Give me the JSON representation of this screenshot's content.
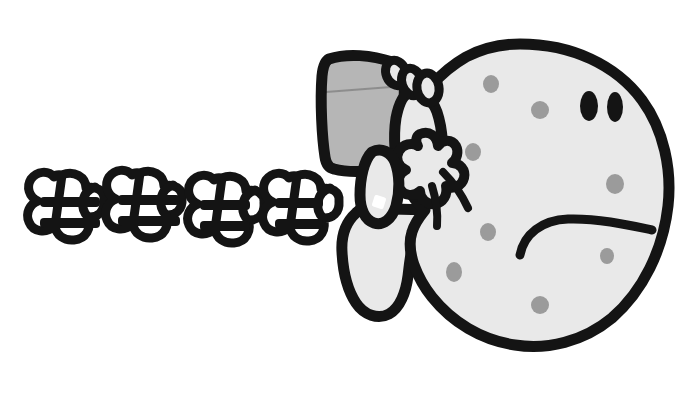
{
  "illustration": {
    "title": "Angry spotted character running and throwing hat",
    "subject": "cartoon-character",
    "background_color": "#ffffff",
    "ink_color": "#141414",
    "body_fill_color": "#e9e9e9",
    "hat_fill_color": "#b6b6b6",
    "spot_color": "#9b9b9b",
    "eye_color": "#141414",
    "mood": "sad-angry"
  },
  "character": {
    "body": {
      "name": "round-spotted-body",
      "outline_width": 11,
      "center": {
        "x": 520,
        "y": 195
      },
      "radius_x": 130,
      "radius_y": 152
    },
    "eyes": [
      {
        "name": "left-eye",
        "cx": 589,
        "cy": 106,
        "rx": 9,
        "ry": 15
      },
      {
        "name": "right-eye",
        "cx": 615,
        "cy": 107,
        "rx": 8,
        "ry": 15
      }
    ],
    "mouth": {
      "name": "frown-mouth",
      "type": "frown-arc",
      "start": {
        "x": 520,
        "y": 255
      },
      "end": {
        "x": 650,
        "y": 230
      },
      "stroke_width": 9
    },
    "spots": [
      {
        "cx": 491,
        "cy": 84,
        "rx": 8,
        "ry": 9
      },
      {
        "cx": 540,
        "cy": 110,
        "rx": 9,
        "ry": 9
      },
      {
        "cx": 473,
        "cy": 152,
        "rx": 8,
        "ry": 9
      },
      {
        "cx": 615,
        "cy": 184,
        "rx": 9,
        "ry": 10
      },
      {
        "cx": 488,
        "cy": 232,
        "rx": 8,
        "ry": 9
      },
      {
        "cx": 454,
        "cy": 272,
        "rx": 8,
        "ry": 10
      },
      {
        "cx": 607,
        "cy": 256,
        "rx": 7,
        "ry": 8
      },
      {
        "cx": 540,
        "cy": 305,
        "rx": 9,
        "ry": 9
      }
    ],
    "hat": {
      "name": "grey-bucket-hat",
      "shape": "tapered-pot",
      "top_left": {
        "x": 326,
        "y": 58
      },
      "top_right": {
        "x": 403,
        "y": 68
      },
      "bottom_right": {
        "x": 393,
        "y": 163
      },
      "bottom_left": {
        "x": 330,
        "y": 168
      }
    },
    "arm": {
      "name": "raised-arm",
      "description": "arm reaching up over head gripping hat brim"
    },
    "hand": {
      "name": "gripping-hand",
      "finger_count": 4
    },
    "leg": {
      "name": "running-leg",
      "description": "foot extending to lower left of body"
    }
  },
  "motion": {
    "name": "speed-puffs",
    "count": 4,
    "puffs": [
      {
        "index": 1,
        "cloud_cx": 40,
        "cloud_cy": 212,
        "lines": 2,
        "line_x1": 40,
        "line_x2": 100
      },
      {
        "index": 2,
        "cloud_cx": 118,
        "cloud_cy": 210,
        "lines": 2,
        "line_x1": 118,
        "line_x2": 178
      },
      {
        "index": 3,
        "cloud_cx": 200,
        "cloud_cy": 215,
        "lines": 2,
        "line_x1": 200,
        "line_x2": 248
      },
      {
        "index": 4,
        "cloud_cx": 275,
        "cloud_cy": 213,
        "lines": 2,
        "line_x1": 275,
        "line_x2": 320
      }
    ],
    "line_stroke_width": 10,
    "cloud_stroke_width": 9
  }
}
